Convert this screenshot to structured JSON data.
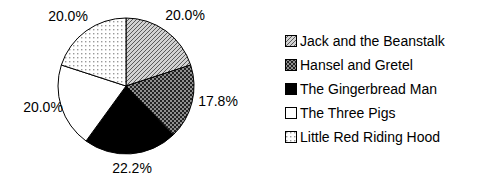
{
  "chart_data": {
    "type": "pie",
    "categories": [
      "Jack and the Beanstalk",
      "Hansel and Gretel",
      "The Gingerbread Man",
      "The Three Pigs",
      "Little Red Riding Hood"
    ],
    "values": [
      20.0,
      17.8,
      22.2,
      20.0,
      20.0
    ],
    "slice_labels": [
      "20.0%",
      "17.8%",
      "22.2%",
      "20.0%",
      "20.0%"
    ],
    "start_angle_deg": 0,
    "direction": "clockwise",
    "legend_position": "right",
    "fill_styles": [
      "diagonal-hatch",
      "dense-crosshatch",
      "solid-black",
      "plain-white",
      "light-dots"
    ],
    "outline_color": "#000000",
    "text_color": "#000000",
    "background_color": "#ffffff"
  }
}
